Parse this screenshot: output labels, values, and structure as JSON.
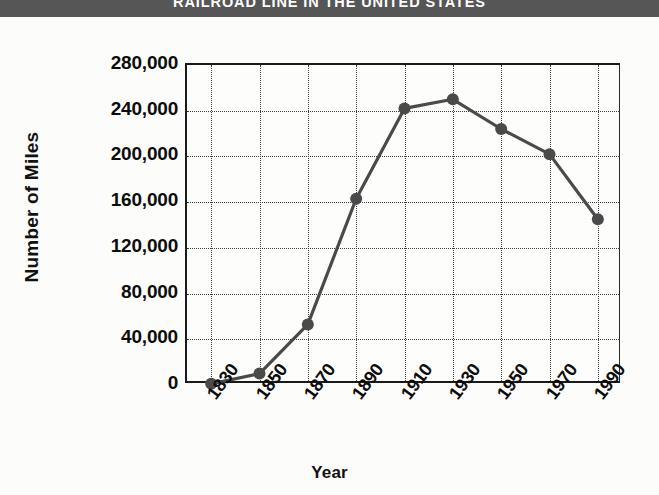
{
  "title": "RAILROAD LINE IN THE UNITED STATES",
  "colors": {
    "title_bar_bg": "#565656",
    "title_text": "#ffffff",
    "series": "#4a4a4a",
    "axis": "#1a1a1a",
    "grid": "#3a3a3a",
    "background": "#fcfcfa"
  },
  "chart_data": {
    "type": "line",
    "title": "RAILROAD LINE IN THE UNITED STATES",
    "xlabel": "Year",
    "ylabel": "Number of Miles",
    "categories": [
      "1830",
      "1850",
      "1870",
      "1890",
      "1910",
      "1930",
      "1950",
      "1970",
      "1990"
    ],
    "values": [
      1000,
      10000,
      53000,
      163000,
      242000,
      250000,
      224000,
      202000,
      145000
    ],
    "series": [
      {
        "name": "Number of Miles",
        "values": [
          1000,
          10000,
          53000,
          163000,
          242000,
          250000,
          224000,
          202000,
          145000
        ]
      }
    ],
    "ylim": [
      0,
      280000
    ],
    "ytick_values": [
      0,
      40000,
      80000,
      120000,
      160000,
      200000,
      240000,
      280000
    ],
    "ytick_labels": [
      "0",
      "40,000",
      "80,000",
      "120,000",
      "160,000",
      "200,000",
      "240,000",
      "280,000"
    ],
    "xtick_labels": [
      "1830",
      "1850",
      "1870",
      "1890",
      "1910",
      "1930",
      "1950",
      "1970",
      "1990"
    ],
    "grid": true,
    "grid_style": "dotted",
    "legend": "none",
    "marker": "circle"
  }
}
